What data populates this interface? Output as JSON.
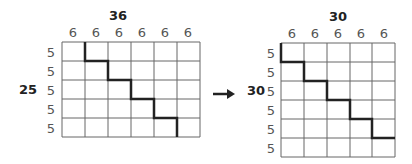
{
  "left_grid": {
    "column_total": "36",
    "row_total": "25",
    "column_labels": [
      "6",
      "6",
      "6",
      "6",
      "6",
      "6"
    ],
    "row_labels": [
      "5",
      "5",
      "5",
      "5",
      "5"
    ]
  },
  "arrow": {
    "icon": "right-arrow-icon"
  },
  "right_grid": {
    "column_total": "30",
    "row_total": "30",
    "column_labels": [
      "6",
      "6",
      "6",
      "6",
      "6"
    ],
    "row_labels": [
      "5",
      "5",
      "5",
      "5",
      "5",
      "5"
    ]
  }
}
